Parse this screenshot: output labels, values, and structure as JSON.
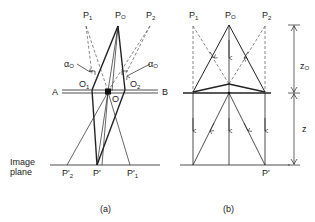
{
  "diagram_a": {
    "labels": {
      "p1": "P",
      "p1_sub": "1",
      "p0": "P",
      "p0_sub": "O",
      "p2": "P",
      "p2_sub": "2",
      "alpha_left": "α",
      "alpha_left_sub": "O",
      "alpha_right": "α",
      "alpha_right_sub": "O",
      "o1": "O",
      "o1_sub": "1",
      "o2": "O",
      "o2_sub": "2",
      "o": "O",
      "a": "A",
      "b": "B",
      "image_plane_line1": "Image",
      "image_plane_line2": "plane",
      "p2_prime": "P'",
      "p2_prime_sub": "2",
      "p_prime": "P'",
      "p1_prime": "P'",
      "p1_prime_sub": "1"
    },
    "caption": "(a)"
  },
  "diagram_b": {
    "labels": {
      "p1": "P",
      "p1_sub": "1",
      "p0": "P",
      "p0_sub": "O",
      "p2": "P",
      "p2_sub": "2",
      "z0": "z",
      "z0_sub": "O",
      "z": "z",
      "p_prime": "P'"
    },
    "caption": "(b)"
  },
  "colors": {
    "line": "#222222",
    "dashed": "#555555",
    "background": "#ffffff"
  }
}
